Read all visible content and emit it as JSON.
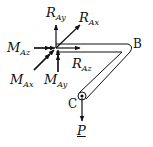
{
  "diagram": {
    "title": "",
    "labels": {
      "R_Ay": {
        "main": "R",
        "sub": "Ay"
      },
      "R_Ax": {
        "main": "R",
        "sub": "Ax"
      },
      "R_Az": {
        "main": "R",
        "sub": "Az"
      },
      "M_Az": {
        "main": "M",
        "sub": "Az"
      },
      "M_Ax": {
        "main": "M",
        "sub": "Ax"
      },
      "M_Ay": {
        "main": "M",
        "sub": "Ay"
      },
      "point_B": "B",
      "point_C": "C",
      "load_P": "P"
    },
    "colors": {
      "stroke": "#111111",
      "background": "#ffffff"
    }
  }
}
